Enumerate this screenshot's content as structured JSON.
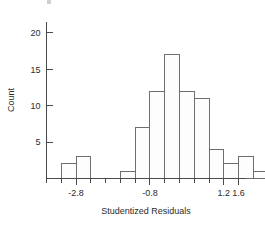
{
  "chart_data": {
    "type": "bar",
    "title": "",
    "subtitle": "",
    "xlabel": "Studentized Residuals",
    "ylabel": "Count",
    "grid": false,
    "legend": false,
    "legend_position": "none",
    "bin_width": 0.4,
    "xlim": [
      -3.6,
      1.8
    ],
    "ylim": [
      0,
      21.5
    ],
    "x_tick_labels": [
      "-2.8",
      "-0.8",
      "1.2",
      "1.6"
    ],
    "x_tick_values": [
      -2.8,
      -0.8,
      1.2,
      1.6
    ],
    "x_minor_tick_values": [
      -3.6,
      -3.2,
      -2.4,
      -2.0,
      -1.6,
      -1.2,
      -0.4,
      0.0,
      0.4,
      0.8,
      1.6
    ],
    "y_tick_labels": [
      "5",
      "10",
      "15",
      "20"
    ],
    "y_tick_values": [
      5,
      10,
      15,
      20
    ],
    "bins": [
      {
        "left": -3.2,
        "right": -2.8,
        "value": 2
      },
      {
        "left": -2.8,
        "right": -2.4,
        "value": 3
      },
      {
        "left": -2.4,
        "right": -2.0,
        "value": 0
      },
      {
        "left": -2.0,
        "right": -1.6,
        "value": 0
      },
      {
        "left": -1.6,
        "right": -1.2,
        "value": 1
      },
      {
        "left": -1.2,
        "right": -0.8,
        "value": 7
      },
      {
        "left": -0.8,
        "right": -0.4,
        "value": 12
      },
      {
        "left": -0.4,
        "right": 0.0,
        "value": 17
      },
      {
        "left": 0.0,
        "right": 0.4,
        "value": 12
      },
      {
        "left": 0.4,
        "right": 0.8,
        "value": 11
      },
      {
        "left": 0.8,
        "right": 1.2,
        "value": 4
      },
      {
        "left": 1.2,
        "right": 1.6,
        "value": 2
      },
      {
        "left": 1.6,
        "right": 2.0,
        "value": 3
      },
      {
        "left": 2.0,
        "right": 2.4,
        "value": 1
      },
      {
        "left": 2.4,
        "right": 2.8,
        "value": 2
      }
    ],
    "categories": [
      "-3.2",
      "-2.8",
      "-2.4",
      "-2.0",
      "-1.6",
      "-1.2",
      "-0.8",
      "-0.4",
      "0.0",
      "0.4",
      "0.8",
      "1.2",
      "1.6",
      "2.0",
      "2.4"
    ],
    "values": [
      2,
      3,
      0,
      0,
      1,
      7,
      12,
      17,
      12,
      11,
      4,
      2,
      3,
      1,
      2
    ],
    "colors": {
      "bar_fill": "#fdfdfd",
      "bar_stroke": "#6e6e6e",
      "axis": "#4a4a4a",
      "text": "#2b2b2b",
      "background": "#ffffff"
    }
  }
}
